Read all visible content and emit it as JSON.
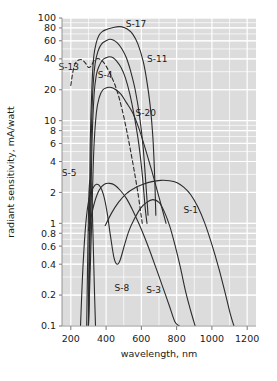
{
  "chart_data": {
    "type": "line",
    "title": "",
    "xlabel": "wavelength, nm",
    "ylabel": "radiant sensitivity, mA/watt",
    "xscale": "linear",
    "yscale": "log",
    "xlim": [
      150,
      1250
    ],
    "ylim": [
      0.1,
      100
    ],
    "grid": true,
    "legend_position": "inline-annotations",
    "xticks": [
      200,
      400,
      600,
      800,
      1000,
      1200
    ],
    "yticks": [
      0.1,
      0.2,
      0.4,
      0.6,
      0.8,
      1,
      2,
      4,
      6,
      8,
      10,
      20,
      40,
      60,
      80,
      100
    ],
    "ytick_labels": [
      "0.1",
      "0.2",
      "0.4",
      "0.6",
      "0.8",
      "1",
      "2",
      "4",
      "6",
      "8",
      "10",
      "20",
      "40",
      "60",
      "80",
      "100"
    ],
    "xtick_labels": [
      "200",
      "400",
      "600",
      "800",
      "1000",
      "1200"
    ],
    "series": [
      {
        "name": "S-17",
        "label": "S-17",
        "label_x": 570,
        "label_y": 88,
        "style": "solid",
        "points": [
          [
            300,
            0.1
          ],
          [
            305,
            1.0
          ],
          [
            310,
            6.0
          ],
          [
            320,
            22
          ],
          [
            330,
            42
          ],
          [
            345,
            58
          ],
          [
            360,
            68
          ],
          [
            380,
            74
          ],
          [
            400,
            77
          ],
          [
            430,
            80
          ],
          [
            460,
            82
          ],
          [
            490,
            82
          ],
          [
            520,
            78
          ],
          [
            550,
            70
          ],
          [
            580,
            56
          ],
          [
            610,
            38
          ],
          [
            630,
            25
          ],
          [
            650,
            14
          ],
          [
            665,
            7.0
          ],
          [
            675,
            3.0
          ],
          [
            682,
            1.2
          ]
        ]
      },
      {
        "name": "S-11",
        "label": "S-11",
        "label_x": 690,
        "label_y": 40,
        "style": "solid",
        "points": [
          [
            300,
            0.1
          ],
          [
            308,
            1.2
          ],
          [
            315,
            6.0
          ],
          [
            325,
            20
          ],
          [
            338,
            36
          ],
          [
            355,
            48
          ],
          [
            375,
            56
          ],
          [
            400,
            60
          ],
          [
            420,
            62
          ],
          [
            440,
            61
          ],
          [
            465,
            57
          ],
          [
            490,
            50
          ],
          [
            515,
            41
          ],
          [
            540,
            30
          ],
          [
            565,
            20
          ],
          [
            590,
            11
          ],
          [
            610,
            5.5
          ],
          [
            625,
            2.5
          ],
          [
            638,
            1.2
          ]
        ]
      },
      {
        "name": "S-13",
        "label": "S-13",
        "label_x": 188,
        "label_y": 33,
        "style": "dashed",
        "points": [
          [
            200,
            22
          ],
          [
            212,
            30
          ],
          [
            225,
            36
          ],
          [
            245,
            39
          ],
          [
            265,
            39
          ],
          [
            285,
            36
          ],
          [
            300,
            33
          ],
          [
            315,
            34
          ],
          [
            330,
            38
          ],
          [
            345,
            40
          ],
          [
            360,
            40
          ],
          [
            380,
            38
          ],
          [
            400,
            34
          ],
          [
            430,
            27
          ],
          [
            460,
            20
          ],
          [
            490,
            13
          ],
          [
            520,
            7.5
          ],
          [
            550,
            4.0
          ],
          [
            580,
            2.0
          ],
          [
            605,
            1.0
          ]
        ]
      },
      {
        "name": "S-4",
        "label": "S-4",
        "label_x": 395,
        "label_y": 28,
        "style": "solid",
        "points": [
          [
            300,
            0.1
          ],
          [
            312,
            1.2
          ],
          [
            320,
            6.0
          ],
          [
            332,
            18
          ],
          [
            345,
            28
          ],
          [
            360,
            34
          ],
          [
            380,
            39
          ],
          [
            400,
            41
          ],
          [
            420,
            42
          ],
          [
            440,
            41
          ],
          [
            460,
            38
          ],
          [
            485,
            33
          ],
          [
            510,
            26
          ],
          [
            535,
            18
          ],
          [
            560,
            11
          ],
          [
            585,
            6.0
          ],
          [
            605,
            3.0
          ],
          [
            622,
            1.4
          ],
          [
            632,
            1.0
          ]
        ]
      },
      {
        "name": "S-20",
        "label": "S-20",
        "label_x": 625,
        "label_y": 12,
        "style": "solid",
        "points": [
          [
            300,
            0.1
          ],
          [
            318,
            1.0
          ],
          [
            330,
            5.0
          ],
          [
            345,
            12
          ],
          [
            362,
            17
          ],
          [
            382,
            20
          ],
          [
            405,
            21
          ],
          [
            430,
            21
          ],
          [
            455,
            20
          ],
          [
            485,
            18
          ],
          [
            515,
            15
          ],
          [
            550,
            12
          ],
          [
            585,
            8.5
          ],
          [
            620,
            5.5
          ],
          [
            660,
            3.2
          ],
          [
            700,
            1.8
          ],
          [
            740,
            1.0
          ]
        ]
      },
      {
        "name": "S-5",
        "label": "S-5",
        "label_x": 190,
        "label_y": 3.1,
        "style": "solid",
        "points": [
          [
            290,
            0.1
          ],
          [
            296,
            0.5
          ],
          [
            302,
            1.8
          ],
          [
            308,
            2.6
          ],
          [
            315,
            2.3
          ],
          [
            322,
            1.3
          ],
          [
            328,
            0.55
          ],
          [
            334,
            0.22
          ],
          [
            340,
            0.1
          ]
        ]
      },
      {
        "name": "S-8",
        "label": "S-8",
        "label_x": 490,
        "label_y": 0.235,
        "style": "solid",
        "points": [
          [
            255,
            0.1
          ],
          [
            268,
            0.35
          ],
          [
            285,
            1.0
          ],
          [
            305,
            1.8
          ],
          [
            325,
            2.2
          ],
          [
            345,
            2.4
          ],
          [
            365,
            2.3
          ],
          [
            385,
            1.9
          ],
          [
            405,
            1.3
          ],
          [
            425,
            0.75
          ],
          [
            445,
            0.46
          ],
          [
            462,
            0.4
          ],
          [
            480,
            0.44
          ],
          [
            505,
            0.62
          ],
          [
            530,
            0.85
          ],
          [
            560,
            1.1
          ],
          [
            595,
            1.4
          ],
          [
            630,
            1.6
          ],
          [
            665,
            1.7
          ],
          [
            700,
            1.6
          ],
          [
            730,
            1.3
          ],
          [
            760,
            0.95
          ],
          [
            790,
            0.62
          ],
          [
            820,
            0.38
          ],
          [
            850,
            0.22
          ],
          [
            880,
            0.14
          ],
          [
            905,
            0.1
          ]
        ]
      },
      {
        "name": "S-3",
        "label": "S-3",
        "label_x": 670,
        "label_y": 0.225,
        "style": "solid",
        "points": [
          [
            300,
            0.85
          ],
          [
            330,
            1.5
          ],
          [
            360,
            2.1
          ],
          [
            390,
            2.4
          ],
          [
            420,
            2.45
          ],
          [
            450,
            2.35
          ],
          [
            480,
            2.1
          ],
          [
            515,
            1.75
          ],
          [
            550,
            1.35
          ],
          [
            585,
            1.0
          ],
          [
            620,
            0.72
          ],
          [
            655,
            0.5
          ],
          [
            690,
            0.34
          ],
          [
            725,
            0.23
          ],
          [
            760,
            0.155
          ],
          [
            790,
            0.11
          ],
          [
            815,
            0.1
          ]
        ]
      },
      {
        "name": "S-1",
        "label": "S-1",
        "label_x": 880,
        "label_y": 1.35,
        "style": "solid",
        "points": [
          [
            395,
            0.95
          ],
          [
            430,
            1.25
          ],
          [
            470,
            1.6
          ],
          [
            515,
            1.95
          ],
          [
            560,
            2.2
          ],
          [
            610,
            2.4
          ],
          [
            660,
            2.55
          ],
          [
            710,
            2.62
          ],
          [
            760,
            2.6
          ],
          [
            800,
            2.5
          ],
          [
            840,
            2.25
          ],
          [
            880,
            1.9
          ],
          [
            920,
            1.45
          ],
          [
            960,
            1.0
          ],
          [
            1000,
            0.62
          ],
          [
            1040,
            0.36
          ],
          [
            1075,
            0.21
          ],
          [
            1105,
            0.13
          ],
          [
            1125,
            0.1
          ]
        ]
      }
    ]
  },
  "axes": {
    "y_label": "radiant sensitivity, mA/watt",
    "x_label": "wavelength, nm"
  },
  "colors": {
    "plot_background": "#dcdcdc",
    "gridline": "#ffffff",
    "curve": "#2b2b2b",
    "text": "#1a1a1a",
    "page_background": "#ffffff"
  }
}
